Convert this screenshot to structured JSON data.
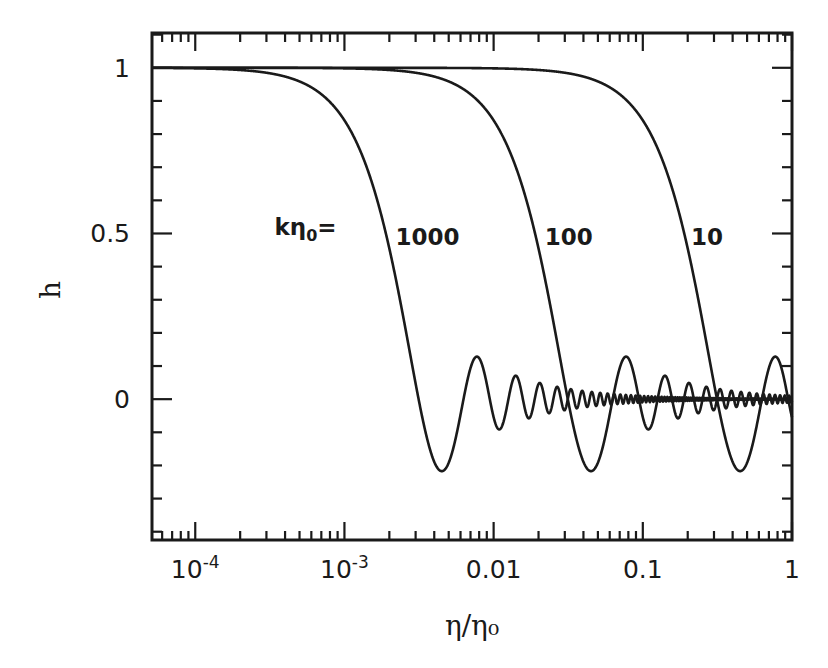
{
  "chart_data": {
    "type": "line",
    "title": "",
    "xlabel": "η/η₀",
    "ylabel": "h",
    "xscale": "log",
    "xlim": [
      5.13e-05,
      1
    ],
    "ylim": [
      -0.425,
      1.105
    ],
    "grid": false,
    "legend": "none (inline curve labels)",
    "x_ticks": [
      {
        "value": 0.0001,
        "label": "10",
        "sup": "-4"
      },
      {
        "value": 0.001,
        "label": "10",
        "sup": "-3"
      },
      {
        "value": 0.01,
        "label": "0.01",
        "sup": ""
      },
      {
        "value": 0.1,
        "label": "0.1",
        "sup": ""
      },
      {
        "value": 1,
        "label": "1",
        "sup": ""
      }
    ],
    "y_ticks": [
      {
        "value": 1,
        "label": "1"
      },
      {
        "value": 0.5,
        "label": "0.5"
      },
      {
        "value": 0,
        "label": "0"
      }
    ],
    "y_minor_step": 0.1,
    "annotation": {
      "text_main": "kη",
      "text_sub": "0",
      "text_suffix": "=",
      "h": 0.52,
      "x": 0.00034
    },
    "series": [
      {
        "name": "kη₀ = 1000",
        "k_eta0": 1000,
        "label": "1000",
        "label_pos": {
          "x": 0.0022,
          "h": 0.49
        },
        "formula": "h = sin(kη)/(kη)",
        "key_points": [
          {
            "x": 0.0001,
            "h": 0.998
          },
          {
            "x": 0.0019,
            "h": 0.5
          },
          {
            "x": 0.00314,
            "h": 0.0
          },
          {
            "x": 0.00449,
            "h": -0.217
          },
          {
            "x": 0.00773,
            "h": 0.128
          },
          {
            "x": 0.0109,
            "h": -0.091
          }
        ]
      },
      {
        "name": "kη₀ = 100",
        "k_eta0": 100,
        "label": "100",
        "label_pos": {
          "x": 0.022,
          "h": 0.49
        },
        "formula": "h = sin(kη)/(kη)",
        "key_points": [
          {
            "x": 0.001,
            "h": 0.998
          },
          {
            "x": 0.019,
            "h": 0.5
          },
          {
            "x": 0.0314,
            "h": 0.0
          },
          {
            "x": 0.0449,
            "h": -0.217
          },
          {
            "x": 0.0773,
            "h": 0.128
          },
          {
            "x": 0.109,
            "h": -0.091
          }
        ]
      },
      {
        "name": "kη₀ = 10",
        "k_eta0": 10,
        "label": "10",
        "label_pos": {
          "x": 0.21,
          "h": 0.49
        },
        "formula": "h = sin(kη)/(kη)",
        "key_points": [
          {
            "x": 0.01,
            "h": 0.998
          },
          {
            "x": 0.19,
            "h": 0.5
          },
          {
            "x": 0.314,
            "h": 0.0
          },
          {
            "x": 0.449,
            "h": -0.217
          },
          {
            "x": 0.773,
            "h": 0.128
          },
          {
            "x": 1.0,
            "h": -0.054
          }
        ]
      }
    ]
  },
  "style": {
    "ink": "#1a1a1a",
    "background": "#ffffff"
  },
  "frame": {
    "left": 152,
    "right": 792,
    "top": 33,
    "bottom": 540
  }
}
